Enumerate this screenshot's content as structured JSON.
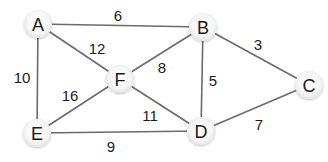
{
  "graph": {
    "nodes": [
      {
        "id": "A",
        "label": "A",
        "x": 38,
        "y": 24
      },
      {
        "id": "B",
        "label": "B",
        "x": 203,
        "y": 27
      },
      {
        "id": "C",
        "label": "C",
        "x": 309,
        "y": 85
      },
      {
        "id": "D",
        "label": "D",
        "x": 201,
        "y": 131
      },
      {
        "id": "E",
        "label": "E",
        "x": 37,
        "y": 133
      },
      {
        "id": "F",
        "label": "F",
        "x": 120,
        "y": 79
      }
    ],
    "edges": [
      {
        "from": "A",
        "to": "B",
        "weight": "6",
        "lx": 118,
        "ly": 15
      },
      {
        "from": "A",
        "to": "F",
        "weight": "12",
        "lx": 97,
        "ly": 48
      },
      {
        "from": "A",
        "to": "E",
        "weight": "10",
        "lx": 22,
        "ly": 77
      },
      {
        "from": "B",
        "to": "F",
        "weight": "8",
        "lx": 162,
        "ly": 67
      },
      {
        "from": "B",
        "to": "C",
        "weight": "3",
        "lx": 258,
        "ly": 44
      },
      {
        "from": "B",
        "to": "D",
        "weight": "5",
        "lx": 213,
        "ly": 80
      },
      {
        "from": "F",
        "to": "E",
        "weight": "16",
        "lx": 70,
        "ly": 95
      },
      {
        "from": "F",
        "to": "D",
        "weight": "11",
        "lx": 150,
        "ly": 115
      },
      {
        "from": "E",
        "to": "D",
        "weight": "9",
        "lx": 111,
        "ly": 146
      },
      {
        "from": "D",
        "to": "C",
        "weight": "7",
        "lx": 259,
        "ly": 124
      }
    ],
    "colors": {
      "edge": "#6b6b6b",
      "node_fill": "#f7f7f7",
      "text": "#1a1a1a"
    }
  }
}
